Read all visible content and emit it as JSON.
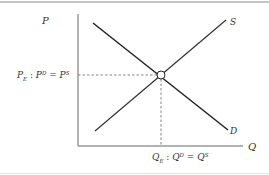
{
  "diagram": {
    "axes": {
      "y_label": "P",
      "x_label": "Q"
    },
    "curves": [
      {
        "name": "Supply",
        "label": "S",
        "slope": "upward"
      },
      {
        "name": "Demand",
        "label": "D",
        "slope": "downward"
      }
    ],
    "equilibrium": {
      "price_label": {
        "main": "P",
        "main_sub": "E",
        "sep": " : ",
        "lhs": "P",
        "lhs_sup": "D",
        "eq": " = ",
        "rhs": "P",
        "rhs_sup": "S"
      },
      "quantity_label": {
        "main": "Q",
        "main_sub": "E",
        "sep": " : ",
        "lhs": "Q",
        "lhs_sup": "D",
        "eq": " = ",
        "rhs": "Q",
        "rhs_sup": "S"
      },
      "guides": "dashed"
    },
    "colors": {
      "axis": "#555555",
      "curve": "#222222",
      "guide": "#555555",
      "text": "#333333",
      "border": "#888888"
    }
  }
}
